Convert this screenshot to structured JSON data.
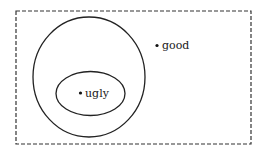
{
  "diagram": {
    "type": "venn-set-diagram",
    "universe": {
      "style": "dashed-rectangle",
      "x": 16,
      "y": 11,
      "width": 235,
      "height": 133,
      "stroke": "#333333"
    },
    "sets": [
      {
        "name": "outer-set",
        "shape": "circle",
        "cx": 89,
        "cy": 77,
        "rx": 56,
        "ry": 60,
        "stroke": "#222222"
      },
      {
        "name": "inner-set",
        "shape": "ellipse",
        "cx": 90.5,
        "cy": 93.5,
        "rx": 34.5,
        "ry": 22,
        "stroke": "#222222"
      }
    ],
    "points": [
      {
        "label": "good",
        "dot_x": 157,
        "dot_y": 45.5,
        "text_x": 162,
        "text_y": 49
      },
      {
        "label": "ugly",
        "dot_x": 80.5,
        "dot_y": 93,
        "text_x": 85,
        "text_y": 97
      }
    ]
  }
}
